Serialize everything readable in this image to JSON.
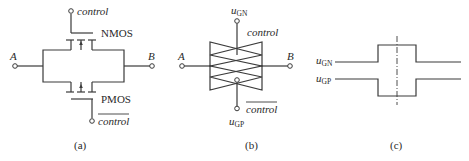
{
  "figure": {
    "panel_a": {
      "caption": "(a)",
      "control_label": "control",
      "control_bar_label": "control",
      "nmos_label": "NMOS",
      "pmos_label": "PMOS",
      "terminal_a": "A",
      "terminal_b": "B"
    },
    "panel_b": {
      "caption": "(b)",
      "ugn_main": "u",
      "ugn_sub": "GN",
      "ugp_main": "u",
      "ugp_sub": "GP",
      "control_label": "control",
      "control_bar_label": "control",
      "terminal_a": "A",
      "terminal_b": "B"
    },
    "panel_c": {
      "caption": "(c)",
      "ugn_main": "u",
      "ugn_sub": "GN",
      "ugp_main": "u",
      "ugp_sub": "GP"
    }
  }
}
